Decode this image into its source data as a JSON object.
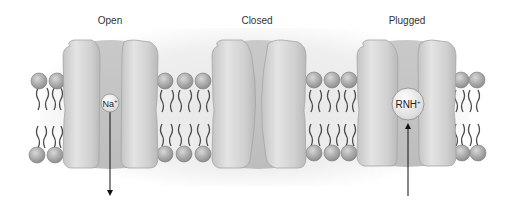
{
  "figure": {
    "type": "ion-channel-states",
    "states": [
      {
        "label": "Open",
        "ion": "Na",
        "ion_charge": "+",
        "arrow_direction": "down"
      },
      {
        "label": "Closed"
      },
      {
        "label": "Plugged",
        "ion": "RNH",
        "ion_charge": "+",
        "arrow_direction": "up"
      }
    ]
  },
  "colors": {
    "background": "#ffffff",
    "membrane_shade": "#e4e4e4",
    "channel_fill": "#cfcfcf",
    "channel_highlight": "#e6e6e6",
    "channel_edge": "#9a9a9a",
    "lipid_head": "#a8a8a8",
    "lipid_tail": "#555555",
    "ion_fill": "#f2f2f2",
    "arrow": "#111111",
    "label_text": "#333333"
  }
}
